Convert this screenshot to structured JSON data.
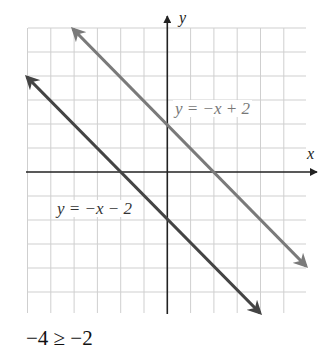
{
  "chart_data": {
    "type": "line",
    "title": "",
    "xlabel": "x",
    "ylabel": "y",
    "xlim": [
      -6,
      6
    ],
    "ylim": [
      -6,
      6
    ],
    "grid": true,
    "tick_labels_shown": false,
    "series": [
      {
        "name": "y = −x + 2",
        "equation": "y = -x + 2",
        "slope": -1,
        "intercept": 2,
        "color": "#7a7a7a",
        "points": [
          [
            -4,
            6
          ],
          [
            6,
            -4
          ]
        ],
        "arrows": "both"
      },
      {
        "name": "y = −x − 2",
        "equation": "y = -x - 2",
        "slope": -1,
        "intercept": -2,
        "color": "#444444",
        "points": [
          [
            -6,
            4
          ],
          [
            4,
            -6
          ]
        ],
        "arrows": "both"
      }
    ],
    "annotations": [
      {
        "text": "y = −x + 2",
        "near_series": 0
      },
      {
        "text": "y = −x − 2",
        "near_series": 1
      }
    ]
  },
  "labels": {
    "x_axis": "x",
    "y_axis": "y",
    "line1": "y = −x + 2",
    "line2": "y = −x − 2",
    "caption": "−4 ≥ −2"
  },
  "colors": {
    "grid": "#cfcfcf",
    "axes": "#222222",
    "line1": "#7a7a7a",
    "line2": "#444444"
  }
}
